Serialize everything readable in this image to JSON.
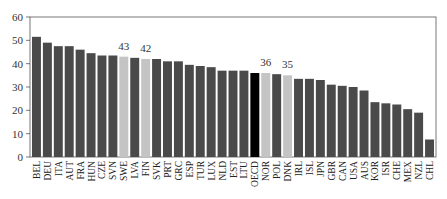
{
  "chart_data": {
    "type": "bar",
    "title": "",
    "xlabel": "",
    "ylabel": "",
    "ylim": [
      0,
      60
    ],
    "yticks": [
      0,
      10,
      20,
      30,
      40,
      50,
      60
    ],
    "grid": false,
    "legend": null,
    "categories": [
      "BEL",
      "DEU",
      "ITA",
      "AUT",
      "FRA",
      "HUN",
      "CZE",
      "SVN",
      "SWE",
      "LVA",
      "FIN",
      "SVK",
      "PRT",
      "GRC",
      "ESP",
      "TUR",
      "LUX",
      "NLD",
      "EST",
      "LTU",
      "OECD",
      "NOR",
      "POL",
      "DNK",
      "IRL",
      "ISL",
      "JPN",
      "GBR",
      "CAN",
      "USA",
      "AUS",
      "KOR",
      "ISR",
      "CHE",
      "MEX",
      "NZL",
      "CHL"
    ],
    "values": [
      51.5,
      49,
      47.5,
      47.5,
      46,
      44.5,
      43.5,
      43.5,
      43,
      42.5,
      42,
      42,
      41,
      41,
      39.5,
      39,
      38.5,
      37,
      37,
      37,
      36,
      36,
      35.5,
      35,
      33.5,
      33.5,
      33,
      31,
      30.5,
      30,
      28.5,
      23.5,
      23,
      22.5,
      20.5,
      19,
      7.5
    ],
    "highlighted": {
      "SWE": {
        "label": "43",
        "style": "light"
      },
      "FIN": {
        "label": "42",
        "style": "light"
      },
      "OECD": {
        "label": "",
        "style": "black"
      },
      "NOR": {
        "label": "36",
        "style": "light"
      },
      "DNK": {
        "label": "35",
        "style": "light"
      }
    },
    "colors": {
      "default": "#4a4a4a",
      "light": "#c4c4c4",
      "black": "#000000",
      "axis": "#555555"
    }
  }
}
